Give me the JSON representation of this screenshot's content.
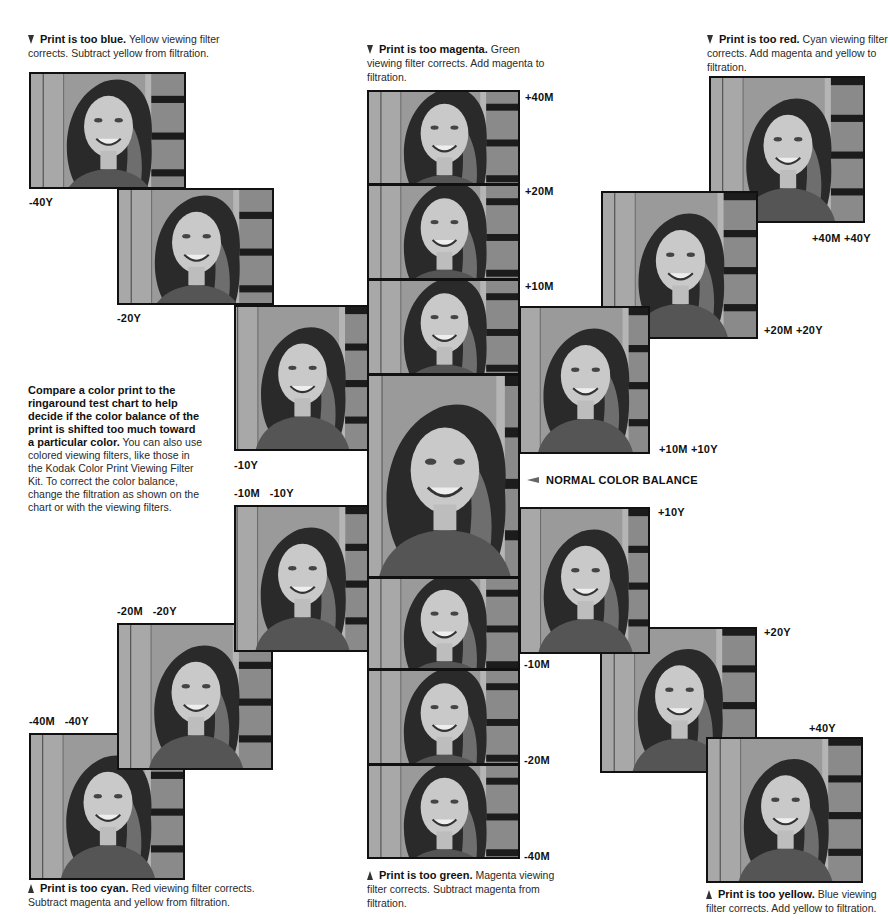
{
  "captions": {
    "too_blue": {
      "bold": "Print is too blue.",
      "text": " Yellow viewing filter corrects. Subtract yellow from filtration."
    },
    "too_magenta": {
      "bold": "Print is too magenta.",
      "text": " Green viewing filter corrects. Add magenta to filtration."
    },
    "too_red": {
      "bold": "Print is too red.",
      "text": " Cyan viewing filter corrects. Add magenta and yellow to filtration."
    },
    "too_cyan": {
      "bold": "Print is too cyan.",
      "text": " Red viewing filter corrects. Subtract magenta and yellow from filtration."
    },
    "too_green": {
      "bold": "Print is too green.",
      "text": " Magenta viewing filter corrects. Subtract magenta from filtration."
    },
    "too_yellow": {
      "bold": "Print is too yellow.",
      "text": " Blue viewing filter corrects. Add yellow to filtration."
    }
  },
  "intro": {
    "bold": "Compare a color print to the ringaround test chart to help decide if the color balance of the print is shifted too much toward a particular color.",
    "text": " You can also use colored viewing filters, like those in the Kodak Color Print Viewing Filter Kit. To correct the color balance, change the filtration as shown on the chart or with the viewing filters."
  },
  "normal_label": "NORMAL COLOR BALANCE",
  "photos": [
    {
      "id": "m40y",
      "label": "-40Y",
      "x": 29,
      "y": 72,
      "w": 157,
      "h": 117,
      "tone": "#7c7c7c"
    },
    {
      "id": "m20y",
      "label": "-20Y",
      "x": 117,
      "y": 188,
      "w": 157,
      "h": 117,
      "tone": "#808080"
    },
    {
      "id": "m10y",
      "label": "-10Y",
      "x": 234,
      "y": 305,
      "w": 135,
      "h": 146,
      "tone": "#838383"
    },
    {
      "id": "p40m",
      "label": "+40M",
      "x": 367,
      "y": 90,
      "w": 153,
      "h": 95,
      "tone": "#7e7e7e"
    },
    {
      "id": "p20m",
      "label": "+20M",
      "x": 367,
      "y": 184,
      "w": 153,
      "h": 96,
      "tone": "#828282"
    },
    {
      "id": "p10m",
      "label": "+10M",
      "x": 367,
      "y": 279,
      "w": 153,
      "h": 96,
      "tone": "#858585"
    },
    {
      "id": "normal",
      "label": "",
      "x": 367,
      "y": 374,
      "w": 153,
      "h": 204,
      "tone": "#888888"
    },
    {
      "id": "m10m",
      "label": "-10M",
      "x": 367,
      "y": 577,
      "w": 153,
      "h": 93,
      "tone": "#868686"
    },
    {
      "id": "m20m",
      "label": "-20M",
      "x": 367,
      "y": 669,
      "w": 153,
      "h": 96,
      "tone": "#8a8a8a"
    },
    {
      "id": "m40m",
      "label": "-40M",
      "x": 367,
      "y": 764,
      "w": 153,
      "h": 95,
      "tone": "#8d8d8d"
    },
    {
      "id": "p40m40y",
      "label": "+40M +40Y",
      "x": 709,
      "y": 76,
      "w": 156,
      "h": 147,
      "tone": "#7a7a7a"
    },
    {
      "id": "p20m20y",
      "label": "+20M +20Y",
      "x": 601,
      "y": 191,
      "w": 157,
      "h": 148,
      "tone": "#7f7f7f"
    },
    {
      "id": "p10m10y",
      "label": "+10M +10Y",
      "x": 519,
      "y": 306,
      "w": 131,
      "h": 148,
      "tone": "#838383"
    },
    {
      "id": "p10y",
      "label": "+10Y",
      "x": 519,
      "y": 507,
      "w": 131,
      "h": 147,
      "tone": "#828282"
    },
    {
      "id": "p20y",
      "label": "+20Y",
      "x": 600,
      "y": 627,
      "w": 157,
      "h": 146,
      "tone": "#7e7e7e"
    },
    {
      "id": "p40y",
      "label": "+40Y",
      "x": 706,
      "y": 737,
      "w": 157,
      "h": 146,
      "tone": "#7b7b7b"
    },
    {
      "id": "m10m10y",
      "label": "-10M  -10Y",
      "x": 234,
      "y": 505,
      "w": 135,
      "h": 147,
      "tone": "#888888"
    },
    {
      "id": "m20m20y",
      "label": "-20M  -20Y",
      "x": 117,
      "y": 623,
      "w": 156,
      "h": 147,
      "tone": "#8b8b8b"
    },
    {
      "id": "m40m40y",
      "label": "-40M  -40Y",
      "x": 29,
      "y": 733,
      "w": 156,
      "h": 147,
      "tone": "#8f8f8f"
    }
  ],
  "labels": {
    "m40y": "-40Y",
    "m20y": "-20Y",
    "m10y": "-10Y",
    "m10m10y": "-10M   -10Y",
    "m20m20y": "-20M   -20Y",
    "m40m40y": "-40M   -40Y",
    "p40m": "+40M",
    "p20m": "+20M",
    "p10m": "+10M",
    "m10m": "-10M",
    "m20m": "-20M",
    "m40m": "-40M",
    "p40m40y": "+40M +40Y",
    "p20m20y": "+20M +20Y",
    "p10m10y": "+10M +10Y",
    "p10y": "+10Y",
    "p20y": "+20Y",
    "p40y": "+40Y"
  },
  "icons": {
    "down_marker": "pointer-down-icon",
    "up_marker": "pointer-up-icon",
    "normal_arrow": "arrow-left-icon"
  }
}
